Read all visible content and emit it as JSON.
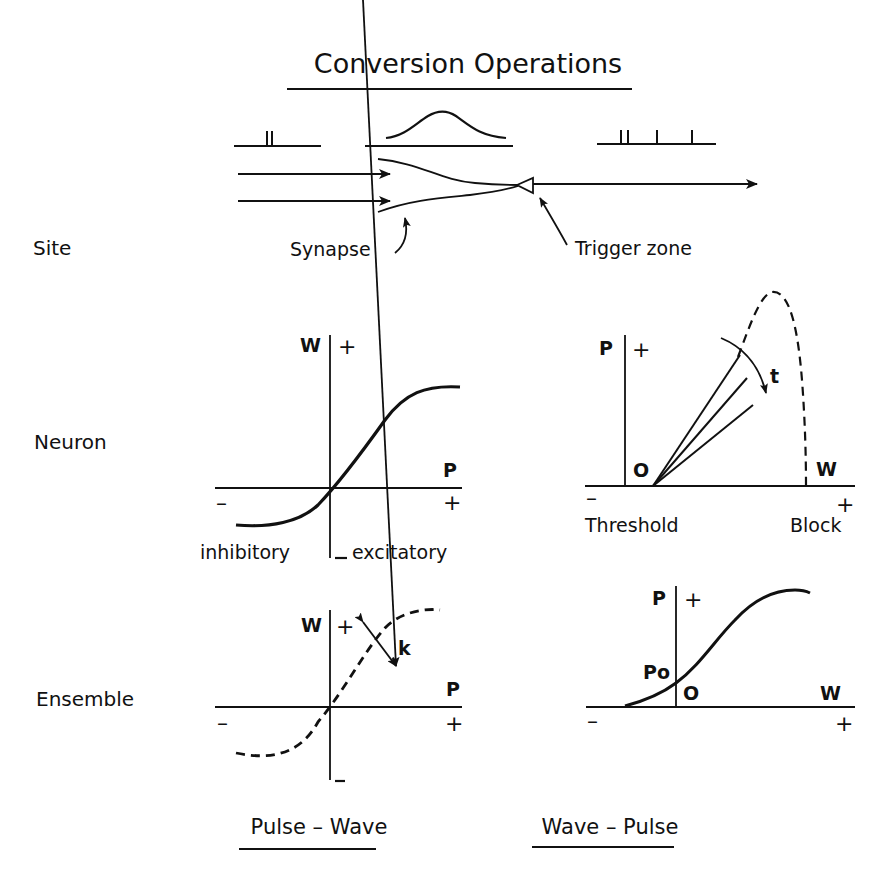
{
  "title": "Conversion Operations",
  "row_labels": {
    "site": "Site",
    "neuron": "Neuron",
    "ensemble": "Ensemble"
  },
  "site_schematic": {
    "synapse_label": "Synapse",
    "trigger_zone_label": "Trigger zone",
    "input_signal": "pulse pair",
    "dendritic_signal": "wave",
    "output_signal": "pulse train"
  },
  "panels": {
    "pulse_wave_neuron": {
      "y_axis": "W",
      "x_axis": "P",
      "y_plus": "+",
      "y_minus": "_",
      "x_plus": "+",
      "x_minus": "–",
      "left_label": "inhibitory",
      "right_label": "excitatory",
      "curve": "solid sigmoid"
    },
    "wave_pulse_neuron": {
      "y_axis": "P",
      "x_axis": "W",
      "y_plus": "+",
      "x_plus": "+",
      "x_minus": "–",
      "origin": "O",
      "left_label": "Threshold",
      "right_label": "Block",
      "param": "t",
      "curve": "fan of lines + dashed envelope"
    },
    "pulse_wave_ensemble": {
      "y_axis": "W",
      "x_axis": "P",
      "y_plus": "+",
      "y_minus": "_",
      "x_plus": "+",
      "x_minus": "–",
      "param": "k",
      "curve": "dashed sigmoid"
    },
    "wave_pulse_ensemble": {
      "y_axis": "P",
      "x_axis": "W",
      "y_plus": "+",
      "x_plus": "+",
      "x_minus": "–",
      "origin": "O",
      "intercept": "Po",
      "curve": "solid sigmoid"
    }
  },
  "column_labels": {
    "left": "Pulse – Wave",
    "right": "Wave – Pulse"
  }
}
